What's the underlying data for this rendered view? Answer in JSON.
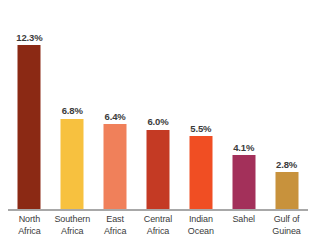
{
  "chart_data": {
    "type": "bar",
    "title": "",
    "subtitle": "",
    "xlabel": "",
    "ylabel": "",
    "ylim": [
      0,
      13.5
    ],
    "grid": false,
    "legend": "none",
    "value_label_suffix": "%",
    "categories": [
      "North\nAfrica",
      "Southern\nAfrica",
      "East\nAfrica",
      "Central\nAfrica",
      "Indian\nOcean",
      "Sahel",
      "Gulf of\nGuinea"
    ],
    "values": [
      12.3,
      6.8,
      6.4,
      6.0,
      5.5,
      4.1,
      2.8
    ],
    "value_labels": [
      "12.3%",
      "6.8%",
      "6.4%",
      "6.0%",
      "5.5%",
      "4.1%",
      "2.8%"
    ],
    "colors": [
      "#8B2914",
      "#F7C13F",
      "#F0805A",
      "#C43A24",
      "#F04E23",
      "#A3305A",
      "#C8923C"
    ]
  },
  "style": {
    "background": "#ffffff",
    "axis_color": "#a8a8a8",
    "label_color": "#3b3b3b"
  }
}
